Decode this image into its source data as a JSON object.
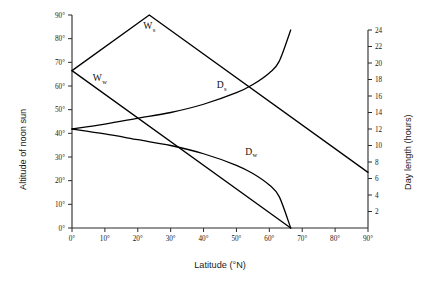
{
  "chart_data": {
    "type": "line",
    "title": "",
    "xlabel": "Latitude (°N)",
    "ylabel": "Altitude of noon sun",
    "ylabel_right": "Day length (hours)",
    "xlim": [
      0,
      90
    ],
    "ylim": [
      0,
      90
    ],
    "ylim_right": [
      0,
      24
    ],
    "grid": false,
    "legend": "inline-labels",
    "x_ticks": [
      "0°",
      "10°",
      "20°",
      "30°",
      "40°",
      "50°",
      "60°",
      "70°",
      "80°",
      "90°"
    ],
    "x_tick_values": [
      0,
      10,
      20,
      30,
      40,
      50,
      60,
      70,
      80,
      90
    ],
    "y_ticks": [
      "0°",
      "10°",
      "20°",
      "30°",
      "40°",
      "50°",
      "60°",
      "70°",
      "80°",
      "90°"
    ],
    "y_tick_values": [
      0,
      10,
      20,
      30,
      40,
      50,
      60,
      70,
      80,
      90
    ],
    "y_ticks_right": [
      "2",
      "4",
      "6",
      "8",
      "10",
      "12",
      "14",
      "16",
      "18",
      "20",
      "22",
      "24"
    ],
    "y_tick_values_right": [
      2,
      4,
      6,
      8,
      10,
      12,
      14,
      16,
      18,
      20,
      22,
      24
    ],
    "series": [
      {
        "name": "Ws",
        "label": "W",
        "sublabel": "s",
        "description": "Altitude of noon sun, summer solstice",
        "axis": "left",
        "x": [
          0,
          23.5,
          90
        ],
        "values": [
          66.5,
          90,
          23.5
        ]
      },
      {
        "name": "Ww",
        "label": "W",
        "sublabel": "w",
        "description": "Altitude of noon sun, winter solstice",
        "axis": "left",
        "x": [
          0,
          66.5
        ],
        "values": [
          66.5,
          0
        ]
      },
      {
        "name": "Ds",
        "label": "D",
        "sublabel": "s",
        "description": "Day length, summer solstice",
        "axis": "right",
        "x": [
          0,
          10,
          20,
          30,
          40,
          50,
          55,
          60,
          63,
          66.5
        ],
        "values": [
          12.0,
          12.6,
          13.3,
          14.0,
          15.0,
          16.4,
          17.4,
          18.8,
          20.2,
          24.0
        ]
      },
      {
        "name": "Dw",
        "label": "D",
        "sublabel": "w",
        "description": "Day length, winter solstice",
        "axis": "right",
        "x": [
          0,
          10,
          20,
          30,
          40,
          50,
          55,
          60,
          63,
          66.5
        ],
        "values": [
          12.0,
          11.4,
          10.7,
          10.0,
          9.0,
          7.6,
          6.6,
          5.2,
          3.8,
          0.0
        ]
      }
    ],
    "annotations": [
      {
        "text": "W",
        "sub": "s",
        "x": 23.5,
        "y": 84
      },
      {
        "text": "W",
        "sub": "w",
        "x": 8.5,
        "y": 62
      },
      {
        "text": "D",
        "sub": "s",
        "x": 45.5,
        "y": 59
      },
      {
        "text": "D",
        "sub": "w",
        "x": 54.5,
        "y": 31
      }
    ]
  }
}
